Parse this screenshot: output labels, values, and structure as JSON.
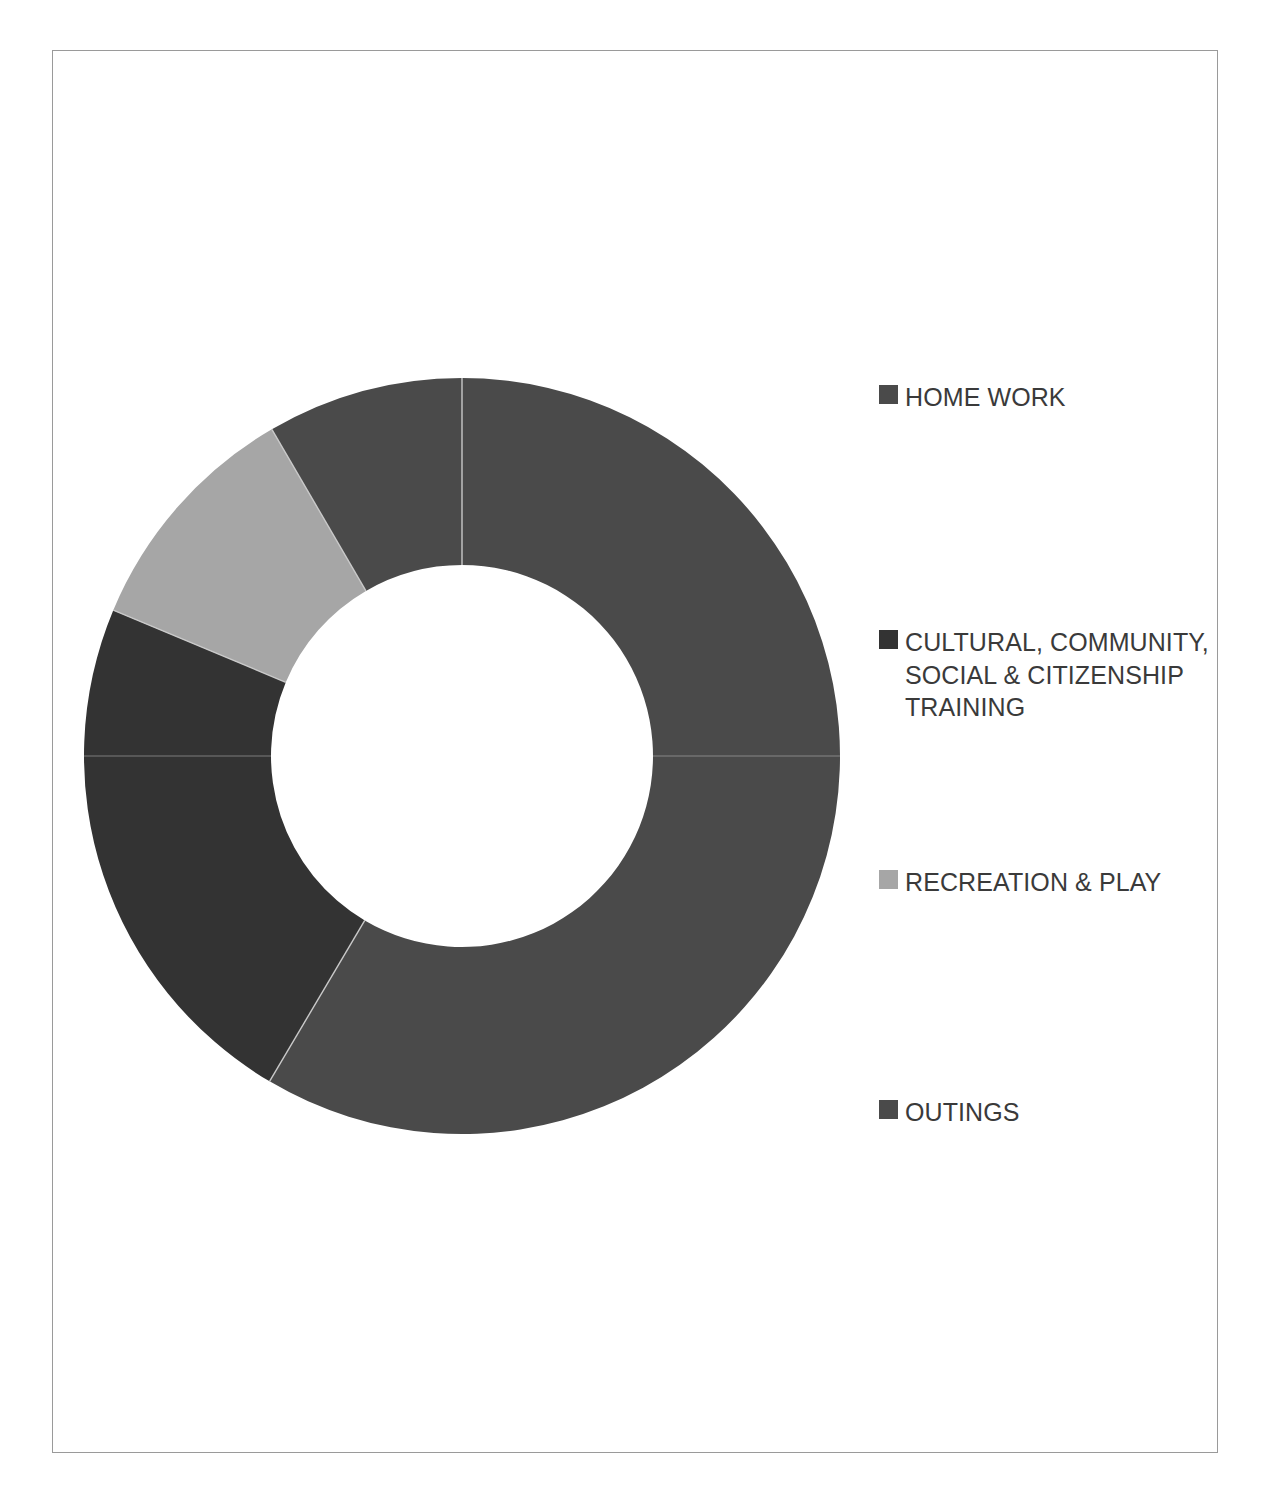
{
  "chart_data": {
    "type": "pie",
    "variant": "donut",
    "title": "",
    "subtitle": "",
    "xlabel": "",
    "ylabel": "",
    "grid": false,
    "legend_position": "right",
    "start_angle_deg": 0,
    "direction": "clockwise",
    "inner_radius_ratio": 0.505,
    "categories": [
      "HOME WORK",
      "CULTURAL, COMMUNITY, SOCIAL & CITIZENSHIP TRAINING",
      "RECREATION & PLAY",
      "OUTINGS"
    ],
    "values": [
      58.5,
      22.8,
      10.3,
      8.4
    ],
    "value_unit": "%",
    "angles_deg": [
      210.6,
      82.1,
      37.1,
      30.2
    ],
    "colors": [
      "#4a4a4a",
      "#333333",
      "#a6a6a6",
      "#4a4a4a"
    ],
    "data_labels_shown": false,
    "slices": [
      {
        "label": "HOME WORK",
        "value": 58.5,
        "color": "#4a4a4a",
        "start_deg": 0.0,
        "end_deg": 210.6
      },
      {
        "label": "CULTURAL, COMMUNITY, SOCIAL & CITIZENSHIP TRAINING",
        "value": 22.8,
        "color": "#333333",
        "start_deg": 210.6,
        "end_deg": 292.7
      },
      {
        "label": "RECREATION & PLAY",
        "value": 10.3,
        "color": "#a6a6a6",
        "start_deg": 292.7,
        "end_deg": 329.8
      },
      {
        "label": "OUTINGS",
        "value": 8.4,
        "color": "#4a4a4a",
        "start_deg": 329.8,
        "end_deg": 360.0
      }
    ]
  },
  "legend": {
    "items": [
      {
        "label": "HOME WORK",
        "color": "#4a4a4a",
        "top": 330
      },
      {
        "label": "CULTURAL, COMMUNITY,\nSOCIAL & CITIZENSHIP\nTRAINING",
        "color": "#333333",
        "top": 575
      },
      {
        "label": "RECREATION & PLAY",
        "color": "#a6a6a6",
        "top": 815
      },
      {
        "label": "OUTINGS",
        "color": "#4a4a4a",
        "top": 1045
      }
    ]
  },
  "frame": {
    "border_color": "#9a9a9a",
    "background": "#ffffff"
  }
}
